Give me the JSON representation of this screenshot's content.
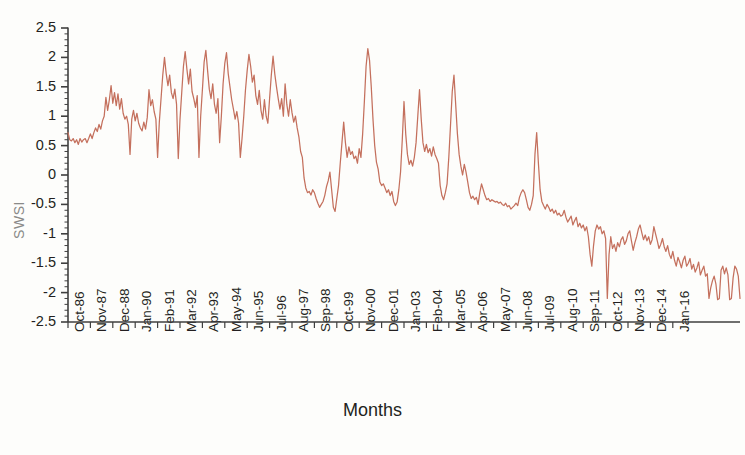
{
  "chart_data": {
    "type": "line",
    "title": "",
    "xlabel": "Months",
    "ylabel": "SWSI",
    "ylim": [
      -2.5,
      2.5
    ],
    "ytick_labels": [
      "2.5",
      "2",
      "1.5",
      "1",
      "0.5",
      "0",
      "-0.5",
      "-1",
      "-1.5",
      "-2",
      "-2.5"
    ],
    "ytick_values": [
      2.5,
      2,
      1.5,
      1,
      0.5,
      0,
      -0.5,
      -1,
      -1.5,
      -2,
      -2.5
    ],
    "yminor_step": 0.1,
    "grid": false,
    "legend": "none",
    "line_color": "#c4705d",
    "axis_color": "#3f3f3f",
    "xtick_labels": [
      "Oct-86",
      "Nov-87",
      "Dec-88",
      "Jan-90",
      "Feb-91",
      "Mar-92",
      "Apr-93",
      "May-94",
      "Jun-95",
      "Jul-96",
      "Aug-97",
      "Sep-98",
      "Oct-99",
      "Nov-00",
      "Dec-01",
      "Jan-03",
      "Feb-04",
      "Mar-05",
      "Apr-06",
      "May-07",
      "Jun-08",
      "Jul-09",
      "Aug-10",
      "Sep-11",
      "Oct-12",
      "Nov-13",
      "Dec-14",
      "Jan-16"
    ],
    "xtick_interval_months": 13,
    "x_start_label": "Oct-86",
    "n_points": 364,
    "series": [
      {
        "name": "SWSI",
        "values": [
          0.72,
          0.6,
          0.58,
          0.62,
          0.55,
          0.6,
          0.52,
          0.62,
          0.56,
          0.6,
          0.62,
          0.55,
          0.62,
          0.7,
          0.62,
          0.72,
          0.8,
          0.74,
          0.86,
          0.78,
          0.92,
          1.0,
          1.32,
          1.1,
          1.28,
          1.52,
          1.22,
          1.4,
          1.18,
          1.38,
          1.12,
          1.3,
          1.05,
          0.95,
          1.0,
          0.86,
          0.35,
          0.95,
          1.1,
          0.92,
          1.05,
          0.88,
          0.8,
          0.75,
          0.9,
          0.78,
          0.98,
          1.45,
          1.18,
          1.28,
          1.08,
          0.95,
          0.3,
          0.9,
          1.3,
          1.7,
          2.0,
          1.72,
          1.52,
          1.7,
          1.4,
          1.3,
          1.46,
          1.2,
          0.28,
          0.95,
          1.4,
          1.85,
          2.1,
          1.8,
          1.55,
          1.8,
          1.42,
          1.3,
          1.15,
          1.35,
          0.3,
          1.0,
          1.45,
          1.92,
          2.12,
          1.78,
          1.46,
          1.3,
          1.55,
          1.2,
          1.05,
          1.3,
          0.55,
          1.0,
          1.55,
          1.9,
          2.08,
          1.72,
          1.5,
          1.28,
          1.12,
          0.95,
          1.08,
          0.88,
          0.3,
          0.62,
          1.0,
          1.45,
          1.78,
          2.05,
          1.85,
          1.58,
          1.7,
          1.35,
          1.2,
          1.44,
          1.1,
          0.95,
          1.28,
          1.0,
          0.88,
          1.3,
          1.7,
          2.02,
          1.72,
          1.5,
          1.3,
          1.12,
          1.3,
          1.0,
          1.55,
          1.2,
          1.0,
          1.28,
          1.06,
          0.9,
          1.0,
          0.8,
          0.65,
          0.4,
          0.3,
          -0.05,
          -0.22,
          -0.3,
          -0.28,
          -0.34,
          -0.25,
          -0.3,
          -0.4,
          -0.48,
          -0.55,
          -0.5,
          -0.45,
          -0.35,
          -0.2,
          -0.1,
          0.05,
          -0.25,
          -0.55,
          -0.62,
          -0.4,
          -0.18,
          0.2,
          0.55,
          0.9,
          0.55,
          0.3,
          0.48,
          0.35,
          0.4,
          0.28,
          0.32,
          0.2,
          0.45,
          0.3,
          0.7,
          1.25,
          1.85,
          2.15,
          1.95,
          1.5,
          0.95,
          0.5,
          0.22,
          0.1,
          -0.12,
          -0.18,
          -0.15,
          -0.22,
          -0.3,
          -0.25,
          -0.35,
          -0.28,
          -0.45,
          -0.52,
          -0.46,
          -0.25,
          0.05,
          0.6,
          1.25,
          0.7,
          0.35,
          0.18,
          0.25,
          0.15,
          0.3,
          0.55,
          1.0,
          1.45,
          0.95,
          0.55,
          0.4,
          0.52,
          0.38,
          0.45,
          0.32,
          0.48,
          0.35,
          0.28,
          0.2,
          -0.18,
          -0.35,
          -0.42,
          -0.3,
          -0.15,
          0.3,
          0.85,
          1.42,
          1.7,
          1.2,
          0.7,
          0.35,
          0.15,
          0.0,
          0.18,
          0.05,
          -0.12,
          -0.3,
          -0.4,
          -0.36,
          -0.42,
          -0.38,
          -0.5,
          -0.3,
          -0.15,
          -0.25,
          -0.35,
          -0.42,
          -0.4,
          -0.45,
          -0.42,
          -0.44,
          -0.46,
          -0.45,
          -0.48,
          -0.46,
          -0.5,
          -0.52,
          -0.48,
          -0.54,
          -0.52,
          -0.58,
          -0.55,
          -0.52,
          -0.48,
          -0.52,
          -0.38,
          -0.3,
          -0.25,
          -0.3,
          -0.42,
          -0.55,
          -0.6,
          -0.5,
          -0.35,
          0.35,
          0.72,
          0.2,
          -0.25,
          -0.45,
          -0.52,
          -0.58,
          -0.5,
          -0.55,
          -0.62,
          -0.58,
          -0.65,
          -0.6,
          -0.68,
          -0.65,
          -0.7,
          -0.68,
          -0.6,
          -0.72,
          -0.8,
          -0.75,
          -0.7,
          -0.85,
          -0.78,
          -0.72,
          -0.88,
          -0.82,
          -0.9,
          -0.85,
          -0.95,
          -0.88,
          -1.05,
          -1.35,
          -1.55,
          -1.2,
          -0.95,
          -0.85,
          -0.92,
          -0.88,
          -1.0,
          -0.95,
          -1.08,
          -2.1,
          -1.35,
          -1.05,
          -1.25,
          -1.18,
          -1.3,
          -1.15,
          -1.22,
          -1.1,
          -1.05,
          -1.18,
          -1.12,
          -1.0,
          -0.95,
          -1.12,
          -1.28,
          -1.15,
          -1.05,
          -0.92,
          -0.85,
          -0.98,
          -1.1,
          -1.02,
          -1.12,
          -1.05,
          -1.18,
          -1.1,
          -0.88,
          -1.0,
          -1.12,
          -1.25,
          -1.18,
          -1.08,
          -1.22,
          -1.3,
          -1.2,
          -1.35,
          -1.42,
          -1.3,
          -1.45,
          -1.55,
          -1.4,
          -1.48,
          -1.58,
          -1.45,
          -1.38,
          -1.55,
          -1.5,
          -1.42,
          -1.6,
          -1.52,
          -1.65,
          -1.58,
          -1.48,
          -1.7,
          -1.62,
          -1.55,
          -1.72,
          -1.68,
          -2.1,
          -1.92,
          -1.8,
          -1.72,
          -1.85,
          -2.12,
          -2.1,
          -1.62,
          -1.55,
          -1.68,
          -1.58,
          -1.7,
          -2.12,
          -2.1,
          -1.75,
          -1.55,
          -1.6,
          -1.72,
          -2.1
        ]
      }
    ]
  }
}
